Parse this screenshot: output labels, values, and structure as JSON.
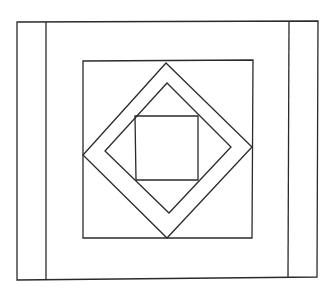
{
  "figure": {
    "type": "quilt-block-line-drawing",
    "background_color": "#ffffff",
    "stroke_color": "#2a2a2a",
    "canvas": {
      "width": 333,
      "height": 291
    },
    "shapes": {
      "outer_frame": {
        "points": "17,22 318,21 317,277 17,280"
      },
      "left_strip_divider": {
        "x1": 46,
        "y1": 22,
        "x2": 46,
        "y2": 280
      },
      "right_strip_divider": {
        "x1": 289,
        "y1": 21,
        "x2": 288,
        "y2": 277
      },
      "inner_square": {
        "points": "83,61 253,60 252,238 83,238"
      },
      "outer_diamond": {
        "points": "166,63 252,147 167,238 83,155"
      },
      "inner_diamond": {
        "points": "167,83 231,147 169,213 105,151"
      },
      "center_square": {
        "points": "135,116 198,116 198,180 136,180"
      }
    }
  }
}
